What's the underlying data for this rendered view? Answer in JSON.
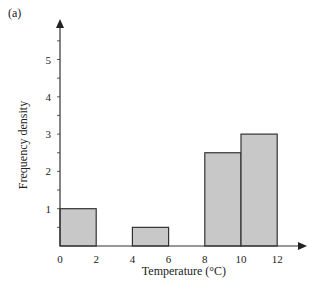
{
  "panel_label": "(a)",
  "chart_data": {
    "type": "histogram",
    "title": "",
    "panel": "(a)",
    "xlabel": "Temperature (°C)",
    "ylabel": "Frequency density",
    "x_ticks": [
      0,
      2,
      4,
      6,
      8,
      10,
      12
    ],
    "y_ticks": [
      1,
      2,
      3,
      4,
      5
    ],
    "y_minor_step": 0.5,
    "xlim": [
      0,
      13.5
    ],
    "ylim": [
      0,
      6
    ],
    "grid": false,
    "legend": null,
    "bins": [
      {
        "x_start": 0,
        "x_end": 2,
        "frequency_density": 1.0
      },
      {
        "x_start": 2,
        "x_end": 4,
        "frequency_density": 0
      },
      {
        "x_start": 4,
        "x_end": 6,
        "frequency_density": 0.5
      },
      {
        "x_start": 6,
        "x_end": 8,
        "frequency_density": 0
      },
      {
        "x_start": 8,
        "x_end": 10,
        "frequency_density": 2.5
      },
      {
        "x_start": 10,
        "x_end": 12,
        "frequency_density": 3.0
      }
    ],
    "bar_color": "#c8c8c8",
    "edge_color": "#333333"
  }
}
